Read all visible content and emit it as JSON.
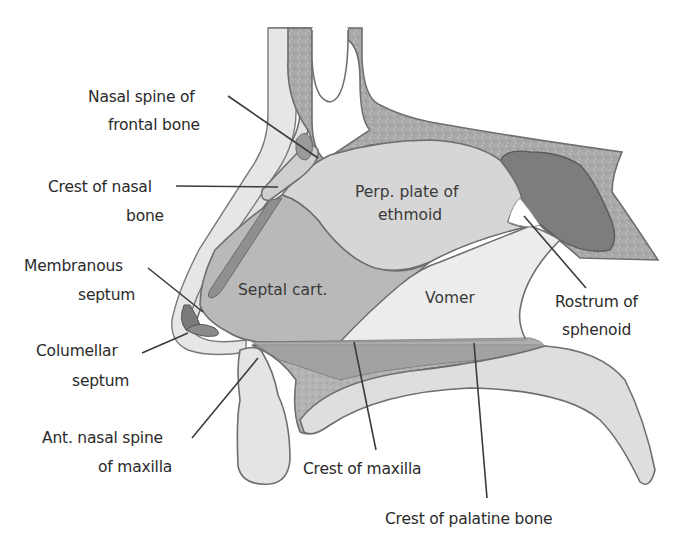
{
  "figure": {
    "colors": {
      "background": "#ffffff",
      "soft_tissue": "#e2e2e2",
      "bone_speckled": "#a9a9a9",
      "perpendicular_plate": "#d6d6d6",
      "septal_cartilage": "#b9b9b9",
      "vomer": "#ececec",
      "sphenoid_sinus": "#7d7d7d",
      "crest_band": "#9f9f9f",
      "outline": "#6e6e6e",
      "label_text": "#2a2a2a"
    }
  },
  "labels": {
    "nasal_spine_frontal": {
      "line1": "Nasal spine of",
      "line2": "frontal bone"
    },
    "crest_nasal_bone": {
      "line1": "Crest of nasal",
      "line2": "bone"
    },
    "membranous_septum": {
      "line1": "Membranous",
      "line2": "septum"
    },
    "columellar_septum": {
      "line1": "Columellar",
      "line2": "septum"
    },
    "ant_nasal_spine": {
      "line1": "Ant. nasal spine",
      "line2": "of maxilla"
    },
    "crest_maxilla": {
      "line1": "Crest of maxilla"
    },
    "crest_palatine": {
      "line1": "Crest of palatine bone"
    },
    "rostrum_sphenoid": {
      "line1": "Rostrum of",
      "line2": "sphenoid"
    }
  },
  "regions": {
    "perp_plate": {
      "line1": "Perp. plate of",
      "line2": "ethmoid"
    },
    "septal_cart": {
      "line1": "Septal cart."
    },
    "vomer": {
      "line1": "Vomer"
    }
  }
}
